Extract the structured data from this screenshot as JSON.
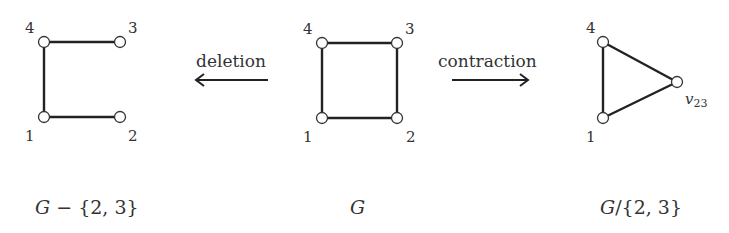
{
  "colors": {
    "edge": "#222222",
    "node_fill": "#ffffff",
    "text": "#333333",
    "background": "#ffffff"
  },
  "operations": {
    "deletion": {
      "label": "deletion",
      "direction": "left"
    },
    "contraction": {
      "label": "contraction",
      "direction": "right"
    }
  },
  "graphs": {
    "deleted": {
      "caption_main": "G",
      "caption_rest": " − {2, 3}",
      "nodes": [
        {
          "id": "1",
          "label": "1",
          "x": 44,
          "y": 117
        },
        {
          "id": "2",
          "label": "2",
          "x": 120,
          "y": 117
        },
        {
          "id": "3",
          "label": "3",
          "x": 120,
          "y": 42
        },
        {
          "id": "4",
          "label": "4",
          "x": 44,
          "y": 42
        }
      ],
      "edges": [
        [
          "4",
          "3"
        ],
        [
          "4",
          "1"
        ],
        [
          "1",
          "2"
        ]
      ]
    },
    "original": {
      "caption_main": "G",
      "nodes": [
        {
          "id": "1",
          "label": "1",
          "x": 322,
          "y": 118
        },
        {
          "id": "2",
          "label": "2",
          "x": 397,
          "y": 118
        },
        {
          "id": "3",
          "label": "3",
          "x": 397,
          "y": 43
        },
        {
          "id": "4",
          "label": "4",
          "x": 322,
          "y": 43
        }
      ],
      "edges": [
        [
          "4",
          "3"
        ],
        [
          "3",
          "2"
        ],
        [
          "2",
          "1"
        ],
        [
          "1",
          "4"
        ]
      ]
    },
    "contracted": {
      "caption_main": "G",
      "caption_rest": "/{2, 3}",
      "nodes": [
        {
          "id": "1",
          "label": "1",
          "x": 603,
          "y": 118
        },
        {
          "id": "4",
          "label": "4",
          "x": 603,
          "y": 42
        },
        {
          "id": "v23",
          "label_main": "v",
          "label_sub": "23",
          "x": 677,
          "y": 82
        }
      ],
      "edges": [
        [
          "4",
          "1"
        ],
        [
          "4",
          "v23"
        ],
        [
          "1",
          "v23"
        ]
      ]
    }
  }
}
